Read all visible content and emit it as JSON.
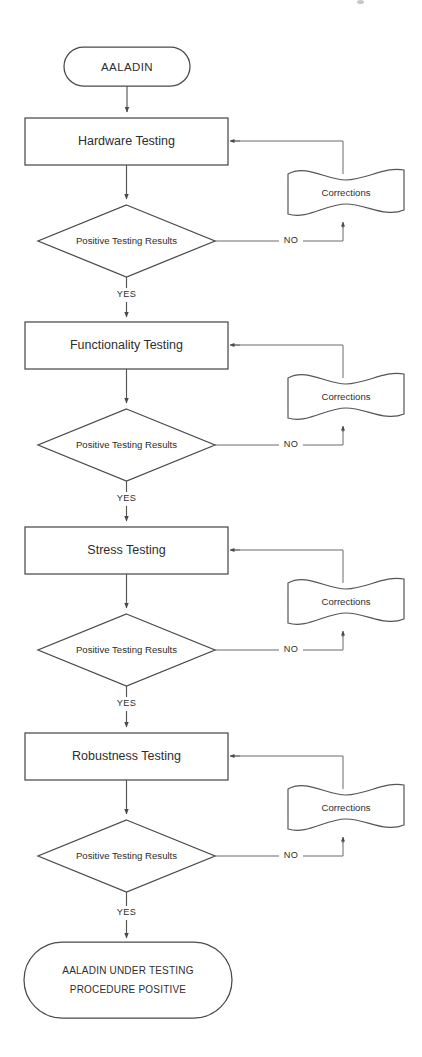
{
  "diagram": {
    "type": "flowchart",
    "background_color": "#ffffff",
    "line_color": "#555555",
    "text_color": "#2e2e2e"
  },
  "start_node": {
    "label": "AALADIN",
    "shape": "terminator"
  },
  "end_node": {
    "line1": "AALADIN UNDER TESTING",
    "line2": "PROCEDURE POSITIVE",
    "shape": "terminator"
  },
  "edge_labels": {
    "yes": "YES",
    "no": "NO"
  },
  "stages": [
    {
      "process": "Hardware Testing",
      "decision": "Positive Testing Results",
      "document": "Corrections",
      "yes_label": "YES",
      "no_label": "NO"
    },
    {
      "process": "Functionality Testing",
      "decision": "Positive Testing Results",
      "document": "Corrections",
      "yes_label": "YES",
      "no_label": "NO"
    },
    {
      "process": "Stress Testing",
      "decision": "Positive Testing Results",
      "document": "Corrections",
      "yes_label": "YES",
      "no_label": "NO"
    },
    {
      "process": "Robustness Testing",
      "decision": "Positive Testing Results",
      "document": "Corrections",
      "yes_label": "YES",
      "no_label": "NO"
    }
  ]
}
